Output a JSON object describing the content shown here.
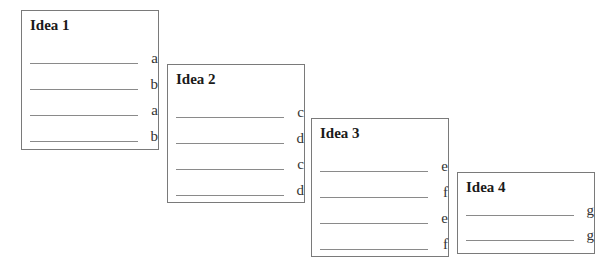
{
  "diagram": {
    "type": "rhyme-scheme-boxes",
    "ideas": [
      {
        "title": "Idea 1",
        "rows": [
          {
            "letter": "a"
          },
          {
            "letter": "b"
          },
          {
            "letter": "a"
          },
          {
            "letter": "b"
          }
        ]
      },
      {
        "title": "Idea 2",
        "rows": [
          {
            "letter": "c"
          },
          {
            "letter": "d"
          },
          {
            "letter": "c"
          },
          {
            "letter": "d"
          }
        ]
      },
      {
        "title": "Idea 3",
        "rows": [
          {
            "letter": "e"
          },
          {
            "letter": "f"
          },
          {
            "letter": "e"
          },
          {
            "letter": "f"
          }
        ]
      },
      {
        "title": "Idea 4",
        "rows": [
          {
            "letter": "g"
          },
          {
            "letter": "g"
          }
        ]
      }
    ]
  },
  "colors": {
    "border": "#7a7a7a",
    "line": "#8a8a8a",
    "text": "#222222",
    "background": "#ffffff"
  }
}
